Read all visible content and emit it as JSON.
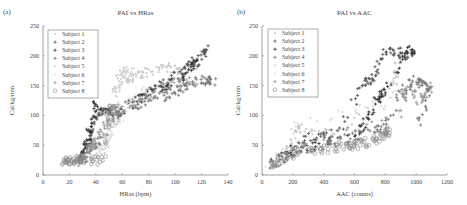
{
  "panels": [
    {
      "label": "(a)",
      "title": "PAI vs HRas",
      "xlabel": "HRas (bpm)",
      "ylabel": "Cal/kg/min"
    },
    {
      "label": "(b)",
      "title": "PAI vs AAC",
      "xlabel": "AAC (counts)",
      "ylabel": "Cal/kg/min"
    }
  ],
  "legend": [
    "Subject 1",
    "Subject 2",
    "Subject 3",
    "Subject 4",
    "Subject 5",
    "Subject 6",
    "Subject 7",
    "Subject 8"
  ],
  "chart_data": [
    {
      "type": "scatter",
      "title": "PAI vs HRas",
      "panel_label": "(a)",
      "xlabel": "HRas (bpm)",
      "ylabel": "Cal/kg/min",
      "xlim": [
        0,
        140
      ],
      "ylim": [
        0,
        250
      ],
      "xticks": [
        0,
        20,
        40,
        60,
        80,
        100,
        120,
        140
      ],
      "yticks": [
        0,
        50,
        100,
        150,
        200,
        250
      ],
      "grid": false,
      "legend_position": "upper left",
      "series": [
        {
          "name": "Subject 1",
          "marker": "point",
          "color": "#c8c8c8",
          "points": [
            [
              45,
              40
            ],
            [
              50,
              60
            ],
            [
              55,
              150
            ],
            [
              60,
              170
            ],
            [
              65,
              160
            ],
            [
              75,
              170
            ],
            [
              85,
              175
            ],
            [
              95,
              180
            ],
            [
              105,
              175
            ],
            [
              115,
              185
            ]
          ]
        },
        {
          "name": "Subject 2",
          "marker": "+",
          "color": "#555555",
          "points": [
            [
              30,
              30
            ],
            [
              35,
              60
            ],
            [
              38,
              90
            ],
            [
              45,
              110
            ],
            [
              60,
              105
            ],
            [
              80,
              140
            ],
            [
              95,
              160
            ],
            [
              110,
              185
            ],
            [
              120,
              200
            ],
            [
              124,
              210
            ]
          ]
        },
        {
          "name": "Subject 3",
          "marker": "+",
          "color": "#333333",
          "points": [
            [
              28,
              25
            ],
            [
              33,
              50
            ],
            [
              36,
              80
            ],
            [
              40,
              120
            ],
            [
              55,
              100
            ],
            [
              75,
              135
            ],
            [
              95,
              150
            ],
            [
              110,
              175
            ],
            [
              118,
              195
            ]
          ]
        },
        {
          "name": "Subject 4",
          "marker": "+",
          "color": "#777777",
          "points": [
            [
              30,
              20
            ],
            [
              38,
              45
            ],
            [
              45,
              60
            ],
            [
              60,
              110
            ],
            [
              80,
              125
            ],
            [
              95,
              135
            ],
            [
              105,
              145
            ],
            [
              115,
              155
            ],
            [
              125,
              160
            ],
            [
              130,
              158
            ]
          ]
        },
        {
          "name": "Subject 5",
          "marker": "point",
          "color": "#d8d8d8",
          "points": [
            [
              40,
              30
            ],
            [
              45,
              50
            ],
            [
              50,
              70
            ],
            [
              55,
              110
            ],
            [
              58,
              160
            ],
            [
              62,
              175
            ],
            [
              70,
              170
            ]
          ]
        },
        {
          "name": "Subject 6",
          "marker": "point",
          "color": "#e5e5e5",
          "points": [
            [
              35,
              25
            ],
            [
              45,
              45
            ],
            [
              55,
              80
            ],
            [
              65,
              120
            ],
            [
              80,
              150
            ]
          ]
        },
        {
          "name": "Subject 7",
          "marker": "+",
          "color": "#999999",
          "points": [
            [
              25,
              20
            ],
            [
              32,
              35
            ],
            [
              40,
              55
            ],
            [
              48,
              90
            ],
            [
              60,
              115
            ],
            [
              80,
              130
            ],
            [
              100,
              155
            ],
            [
              120,
              158
            ]
          ]
        },
        {
          "name": "Subject 8",
          "marker": "o",
          "color": "#888888",
          "points": [
            [
              16,
              20
            ],
            [
              20,
              22
            ],
            [
              25,
              28
            ],
            [
              30,
              25
            ],
            [
              45,
              22
            ],
            [
              50,
              110
            ],
            [
              55,
              110
            ]
          ]
        }
      ]
    },
    {
      "type": "scatter",
      "title": "PAI vs AAC",
      "panel_label": "(b)",
      "xlabel": "AAC (counts)",
      "ylabel": "Cal/kg/min",
      "xlim": [
        0,
        1200
      ],
      "ylim": [
        0,
        250
      ],
      "xticks": [
        0,
        200,
        400,
        600,
        800,
        1000,
        1200
      ],
      "yticks": [
        0,
        50,
        100,
        150,
        200,
        250
      ],
      "grid": false,
      "legend_position": "upper left",
      "series": [
        {
          "name": "Subject 1",
          "marker": "point",
          "color": "#c8c8c8",
          "points": [
            [
              50,
              20
            ],
            [
              150,
              35
            ],
            [
              230,
              80
            ],
            [
              300,
              75
            ],
            [
              500,
              70
            ],
            [
              850,
              150
            ],
            [
              880,
              190
            ]
          ]
        },
        {
          "name": "Subject 2",
          "marker": "+",
          "color": "#555555",
          "points": [
            [
              60,
              15
            ],
            [
              150,
              30
            ],
            [
              240,
              45
            ],
            [
              320,
              65
            ],
            [
              500,
              70
            ],
            [
              660,
              155
            ],
            [
              720,
              155
            ],
            [
              780,
              205
            ],
            [
              880,
              208
            ],
            [
              950,
              200
            ]
          ]
        },
        {
          "name": "Subject 3",
          "marker": "+",
          "color": "#333333",
          "points": [
            [
              70,
              18
            ],
            [
              140,
              30
            ],
            [
              220,
              45
            ],
            [
              600,
              65
            ],
            [
              700,
              95
            ],
            [
              760,
              130
            ],
            [
              790,
              140
            ],
            [
              950,
              210
            ],
            [
              980,
              205
            ]
          ]
        },
        {
          "name": "Subject 4",
          "marker": "+",
          "color": "#777777",
          "points": [
            [
              80,
              20
            ],
            [
              160,
              30
            ],
            [
              250,
              40
            ],
            [
              500,
              55
            ],
            [
              700,
              75
            ],
            [
              800,
              80
            ],
            [
              900,
              140
            ],
            [
              1000,
              160
            ],
            [
              1050,
              150
            ],
            [
              1090,
              145
            ],
            [
              1000,
              80
            ]
          ]
        },
        {
          "name": "Subject 5",
          "marker": "point",
          "color": "#d8d8d8",
          "points": [
            [
              40,
              15
            ],
            [
              120,
              25
            ],
            [
              230,
              85
            ],
            [
              840,
              120
            ],
            [
              870,
              170
            ]
          ]
        },
        {
          "name": "Subject 6",
          "marker": "point",
          "color": "#e5e5e5",
          "points": [
            [
              60,
              18
            ],
            [
              160,
              30
            ],
            [
              260,
              50
            ]
          ]
        },
        {
          "name": "Subject 7",
          "marker": "+",
          "color": "#999999",
          "points": [
            [
              70,
              15
            ],
            [
              140,
              28
            ],
            [
              240,
              45
            ],
            [
              880,
              100
            ],
            [
              950,
              150
            ],
            [
              1020,
              120
            ],
            [
              1100,
              150
            ]
          ]
        },
        {
          "name": "Subject 8",
          "marker": "o",
          "color": "#888888",
          "points": [
            [
              60,
              20
            ],
            [
              320,
              42
            ],
            [
              430,
              45
            ],
            [
              550,
              48
            ],
            [
              620,
              52
            ],
            [
              730,
              57
            ],
            [
              800,
              65
            ],
            [
              820,
              75
            ]
          ]
        }
      ]
    }
  ]
}
